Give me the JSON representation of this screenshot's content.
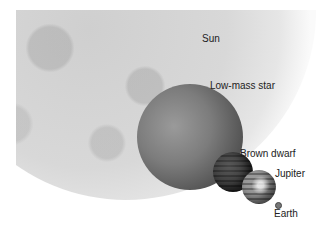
{
  "labels": {
    "sun": "Sun",
    "low_mass_star": "Low-mass star",
    "brown_dwarf": "Brown dwarf",
    "jupiter": "Jupiter",
    "earth": "Earth"
  },
  "colors": {
    "background": "#ffffff",
    "sun": "#d6d6d6",
    "low_mass_star": "#6e6e6e",
    "brown_dwarf": "#303030",
    "jupiter": "#8a8a8a",
    "earth": "#777777",
    "label_text": "#222222"
  }
}
